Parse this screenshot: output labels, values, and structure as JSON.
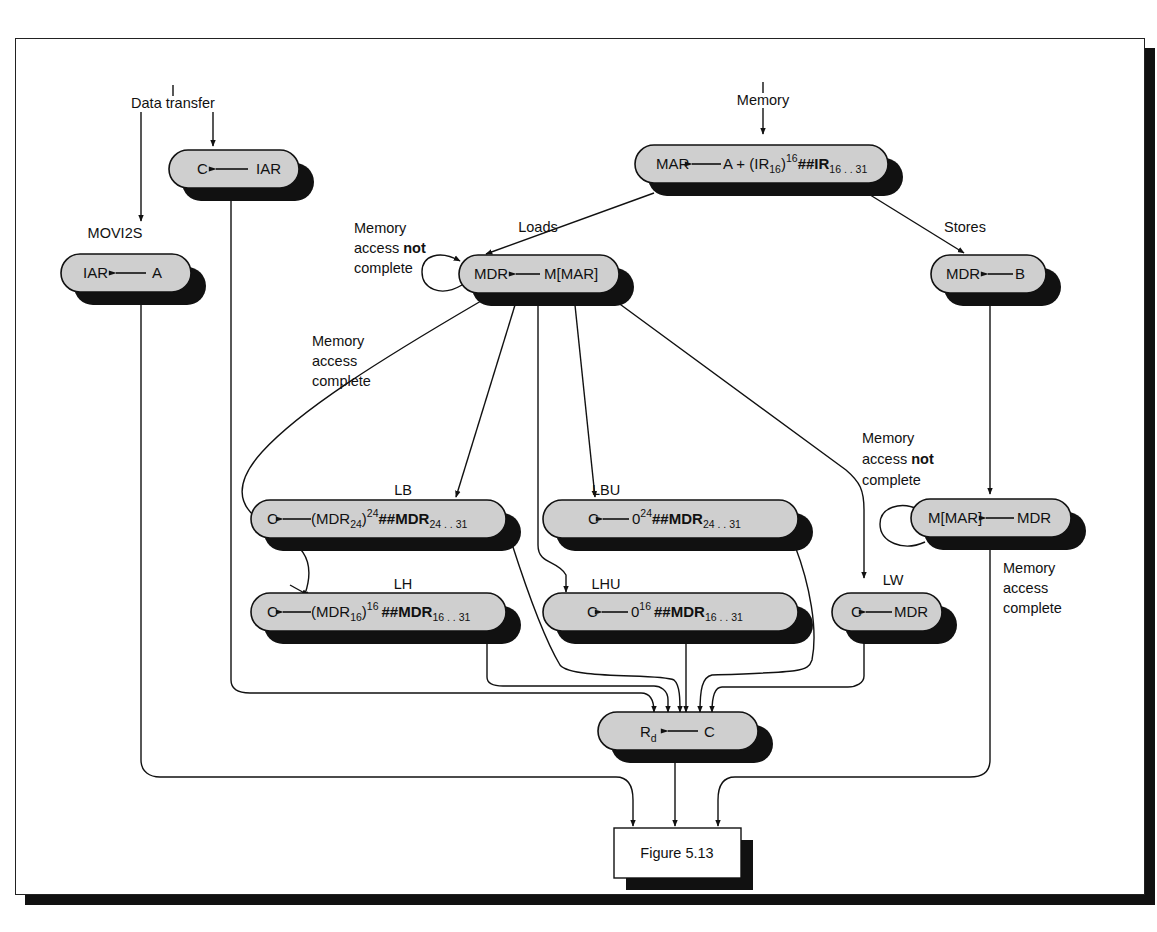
{
  "figure": {
    "caption_box": "Figure 5.13"
  },
  "entry_labels": {
    "data_transfer": "Data transfer",
    "memory": "Memory"
  },
  "branch_labels": {
    "movs2i": "MOVS2I",
    "movi2s": "MOVI2S",
    "loads": "Loads",
    "stores": "Stores",
    "lb": "LB",
    "lbu": "LBU",
    "lh": "LH",
    "lhu": "LHU",
    "lw": "LW"
  },
  "annotations": {
    "load_not_complete": [
      "Memory",
      "access",
      "not",
      "complete"
    ],
    "load_complete": [
      "Memory",
      "access",
      "complete"
    ],
    "store_not_complete": [
      "Memory",
      "access",
      "not",
      "complete"
    ],
    "store_complete": [
      "Memory",
      "access",
      "complete"
    ]
  },
  "nodes": {
    "movs2i": {
      "dest": "C",
      "src": "IAR"
    },
    "movi2s": {
      "dest": "IAR",
      "src": "A"
    },
    "addr": {
      "dest": "MAR",
      "src_a": "A + (IR",
      "src_a_sub": "16",
      "src_b": ")",
      "src_b_sup": "16",
      "src_c": "##IR",
      "src_c_sub": "16 . . 31"
    },
    "load_mem": {
      "dest": "MDR",
      "src": "M[MAR]"
    },
    "store_mdr": {
      "dest": "MDR",
      "src": "B"
    },
    "lb": {
      "dest": "C",
      "p1": "(MDR",
      "p1_sub": "24",
      "p2": ")",
      "p2_sup": "24",
      "p3": "##MDR",
      "p3_sub": "24 . . 31"
    },
    "lbu": {
      "dest": "C",
      "p1": "0",
      "p1_sup": "24",
      "p2": "##MDR",
      "p2_sub": "24 . . 31"
    },
    "lh": {
      "dest": "C",
      "p1": "(MDR",
      "p1_sub": "16",
      "p2": ")",
      "p2_sup": "16",
      "p3": "##MDR",
      "p3_sub": "16 . . 31"
    },
    "lhu": {
      "dest": "C",
      "p1": "0",
      "p1_sup": "16",
      "p2": "##MDR",
      "p2_sub": "16 . . 31"
    },
    "lw": {
      "dest": "C",
      "src": "MDR"
    },
    "store_mem": {
      "dest": "M[MAR]",
      "src": "MDR"
    },
    "writeback": {
      "dest": "R",
      "dest_sub": "d",
      "src": "C"
    }
  },
  "colors": {
    "node_fill": "#cfcfcf",
    "shadow": "#111111",
    "line": "#111111",
    "background": "#ffffff"
  }
}
